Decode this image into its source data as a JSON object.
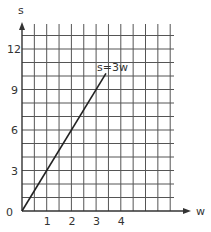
{
  "chart_data": {
    "type": "line",
    "title": "",
    "xlabel": "w",
    "ylabel": "s",
    "xlim": [
      0,
      6
    ],
    "ylim": [
      0,
      13
    ],
    "x_ticks": [
      "1",
      "2",
      "3",
      "4"
    ],
    "y_ticks": [
      "3",
      "6",
      "9",
      "12"
    ],
    "origin_label": "0",
    "grid": true,
    "series": [
      {
        "name": "s=3w",
        "x": [
          0,
          3.4
        ],
        "y": [
          0,
          10.2
        ]
      }
    ],
    "annotations": [
      {
        "text": "s=3w",
        "x": 3.3,
        "y": 10.8
      }
    ]
  }
}
